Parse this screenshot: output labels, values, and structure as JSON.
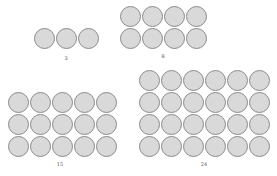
{
  "figure": {
    "circle_fill": "#d9d9d9",
    "circle_stroke": "#8a8a8a",
    "groups": [
      {
        "label": "3",
        "rows": 1,
        "cols": 3,
        "x": 33,
        "y": 28,
        "label_x": 66,
        "label_y": 55
      },
      {
        "label": "8",
        "rows": 2,
        "cols": 4,
        "x": 119,
        "y": 6,
        "label_x": 163,
        "label_y": 53
      },
      {
        "label": "15",
        "rows": 3,
        "cols": 5,
        "x": 7,
        "y": 92,
        "label_x": 60,
        "label_y": 161
      },
      {
        "label": "24",
        "rows": 4,
        "cols": 6,
        "x": 138,
        "y": 70,
        "label_x": 204,
        "label_y": 161
      }
    ]
  }
}
